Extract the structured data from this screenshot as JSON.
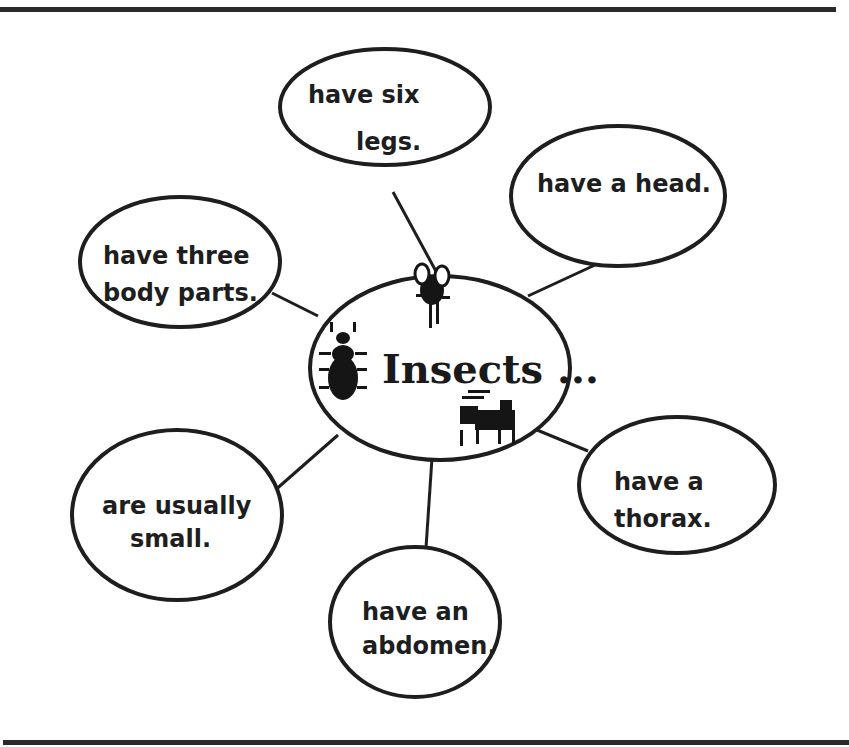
{
  "diagram": {
    "type": "concept web",
    "center": {
      "label": "Insects ...",
      "icons": [
        "fly-icon",
        "beetle-icon",
        "grasshopper-icon"
      ]
    },
    "nodes": [
      {
        "id": "legs",
        "line1": "have six",
        "line2": "legs."
      },
      {
        "id": "head",
        "line1": "have a head.",
        "line2": ""
      },
      {
        "id": "body-parts",
        "line1": "have three",
        "line2": "body parts."
      },
      {
        "id": "small",
        "line1": "are usually",
        "line2": "small."
      },
      {
        "id": "abdomen",
        "line1": "have an",
        "line2": "abdomen."
      },
      {
        "id": "thorax",
        "line1": "have a",
        "line2": "thorax."
      }
    ],
    "colors": {
      "ink": "#1e1e1e",
      "background": "#ffffff",
      "rule": "#2a2a2a"
    }
  }
}
